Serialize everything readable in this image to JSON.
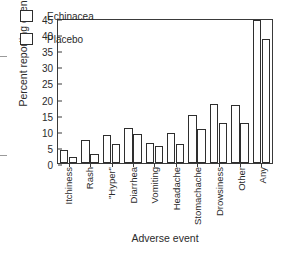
{
  "chart_data": {
    "type": "bar",
    "title": "",
    "xlabel": "Adverse event",
    "ylabel": "Percent reporting event",
    "categories": [
      "Itchiness",
      "Rash",
      "\"Hyper\"",
      "Diarrhea",
      "Vomiting",
      "Headache",
      "Stomachache",
      "Drowsiness",
      "Other",
      "Any"
    ],
    "series": [
      {
        "name": "Echinacea",
        "values": [
          4,
          7,
          8.7,
          11,
          6.2,
          9.4,
          15,
          18.2,
          18,
          44.5
        ]
      },
      {
        "name": "Placebo",
        "values": [
          2,
          2.7,
          6,
          9,
          5.3,
          6,
          10.5,
          12.3,
          12.3,
          38.5
        ]
      }
    ],
    "ylim": [
      0,
      45
    ],
    "yticks": [
      0,
      5,
      10,
      15,
      20,
      25,
      30,
      35,
      40,
      45
    ],
    "ytick_labels": [
      "0",
      "5",
      "10",
      "15",
      "20",
      "25",
      "30",
      "35",
      "40",
      "45"
    ],
    "grid": false,
    "legend_position": "upper-left-inside",
    "bar_style": {
      "fill": "#ffffff",
      "edge": "#2e2e2e"
    }
  },
  "legend": {
    "entries": [
      {
        "label": "Echinacea"
      },
      {
        "label": "Placebo"
      }
    ]
  }
}
